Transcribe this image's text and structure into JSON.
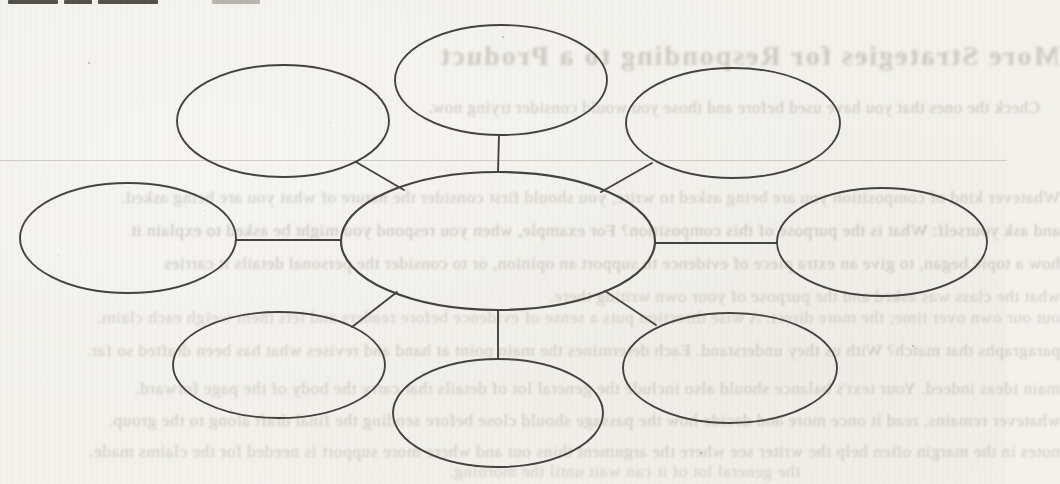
{
  "page": {
    "width": 1007,
    "height": 484,
    "paper_color": "#f2f1ec",
    "ink_color": "#44423e",
    "scan_artifact_line_y": 160
  },
  "top_edge_cut_text_fragments": [
    {
      "x": 8,
      "width": 50,
      "light": false
    },
    {
      "x": 64,
      "width": 28,
      "light": false
    },
    {
      "x": 98,
      "width": 60,
      "light": false
    },
    {
      "x": 212,
      "width": 48,
      "light": true
    }
  ],
  "diagram": {
    "type": "cluster-web",
    "stroke": "#45433f",
    "stroke_width": 1.9,
    "nodes": [
      {
        "id": "center",
        "label": "",
        "cx": 498,
        "cy": 241,
        "rx": 157,
        "ry": 69,
        "sw": 2.2
      },
      {
        "id": "top-left",
        "label": "",
        "cx": 283,
        "cy": 121,
        "rx": 106,
        "ry": 56,
        "sw": 1.9
      },
      {
        "id": "top-center",
        "label": "",
        "cx": 501,
        "cy": 80,
        "rx": 106,
        "ry": 55,
        "sw": 1.9
      },
      {
        "id": "top-right",
        "label": "",
        "cx": 733,
        "cy": 123,
        "rx": 107,
        "ry": 55,
        "sw": 1.9
      },
      {
        "id": "middle-left",
        "label": "",
        "cx": 128,
        "cy": 238,
        "rx": 108,
        "ry": 55,
        "sw": 1.9
      },
      {
        "id": "middle-right",
        "label": "",
        "cx": 882,
        "cy": 242,
        "rx": 105,
        "ry": 54,
        "sw": 1.9
      },
      {
        "id": "bottom-left",
        "label": "",
        "cx": 279,
        "cy": 365,
        "rx": 106,
        "ry": 53,
        "sw": 1.9
      },
      {
        "id": "bottom-center",
        "label": "",
        "cx": 498,
        "cy": 413,
        "rx": 105,
        "ry": 54,
        "sw": 1.9
      },
      {
        "id": "bottom-right",
        "label": "",
        "cx": 730,
        "cy": 368,
        "rx": 107,
        "ry": 55,
        "sw": 1.9
      }
    ],
    "links": [
      {
        "from": "top-center",
        "to": "center",
        "x1": 499,
        "y1": 135,
        "x2": 498,
        "y2": 172
      },
      {
        "from": "top-left",
        "to": "center",
        "x1": 356,
        "y1": 162,
        "x2": 404,
        "y2": 190
      },
      {
        "from": "top-right",
        "to": "center",
        "x1": 652,
        "y1": 163,
        "x2": 601,
        "y2": 192
      },
      {
        "from": "middle-left",
        "to": "center",
        "x1": 236,
        "y1": 240,
        "x2": 341,
        "y2": 240
      },
      {
        "from": "middle-right",
        "to": "center",
        "x1": 655,
        "y1": 243,
        "x2": 777,
        "y2": 243
      },
      {
        "from": "bottom-left",
        "to": "center",
        "x1": 397,
        "y1": 292,
        "x2": 352,
        "y2": 327
      },
      {
        "from": "bottom-center",
        "to": "center",
        "x1": 498,
        "y1": 310,
        "x2": 498,
        "y2": 359
      },
      {
        "from": "bottom-right",
        "to": "center",
        "x1": 605,
        "y1": 291,
        "x2": 656,
        "y2": 325
      }
    ]
  },
  "bleedthrough": {
    "note": "mirrored show-through of printed text from the reverse side of the scanned page; legible only in part",
    "color": "#9a9486",
    "lines": [
      {
        "top": 41,
        "left": 330,
        "width": 730,
        "size": 28,
        "bold": true,
        "opacity": 0.42,
        "text": "More Strategies for Responding to a Product"
      },
      {
        "top": 99,
        "left": 340,
        "width": 700,
        "size": 17,
        "bold": false,
        "opacity": 0.45,
        "text": "Check the ones that you have used before and those you would consider trying now."
      },
      {
        "top": 188,
        "left": -40,
        "width": 1100,
        "size": 17.5,
        "bold": false,
        "opacity": 0.42,
        "text": "Whatever kind of composition you are being asked to write, you should first consider the nature of what you are being asked."
      },
      {
        "top": 221,
        "left": -40,
        "width": 1100,
        "size": 17.5,
        "bold": false,
        "opacity": 0.5,
        "text": "and ask yourself: What is the purpose of this composition? For example, when you respond you might be asked to explain it"
      },
      {
        "top": 254,
        "left": -40,
        "width": 1100,
        "size": 17.5,
        "bold": false,
        "opacity": 0.45,
        "text": "how a topic began, to give an extra piece of evidence to support an opinion, or to consider the personal details it carries"
      },
      {
        "top": 287,
        "left": -40,
        "width": 1100,
        "size": 17.5,
        "bold": false,
        "opacity": 0.38,
        "text": "what the class was asked and the purpose of your own writing there."
      },
      {
        "top": 308,
        "left": -40,
        "width": 1100,
        "size": 17.5,
        "bold": false,
        "opacity": 0.36,
        "text": "out our own over time; the more direct. A wise direction puts a sense of evidence before readers and lets them weigh each claim."
      },
      {
        "top": 341,
        "left": -40,
        "width": 1100,
        "size": 17.5,
        "bold": false,
        "opacity": 0.42,
        "text": "paragraphs that match? With us they understand. Each determines the main point at hand and revises what has been drafted so far."
      },
      {
        "top": 379,
        "left": -40,
        "width": 1100,
        "size": 17.5,
        "bold": false,
        "opacity": 0.4,
        "text": "main ideas indeed. Your text's balance should also include the general lot of details that carry the body of the page forward."
      },
      {
        "top": 411,
        "left": -40,
        "width": 1100,
        "size": 17.5,
        "bold": false,
        "opacity": 0.42,
        "text": "whatever remains, read it once more and decide how the passage should close before sending the final draft along to the group."
      },
      {
        "top": 442,
        "left": -40,
        "width": 1100,
        "size": 17.5,
        "bold": false,
        "opacity": 0.4,
        "text": "notes in the margin often help the writer see where the argument thins out and where more support is needed for the claims made."
      },
      {
        "top": 462,
        "left": 240,
        "width": 560,
        "size": 17.5,
        "bold": false,
        "opacity": 0.34,
        "text": "the general lot of it can wait until the morning."
      }
    ]
  },
  "paper_specks": [
    {
      "x": 88,
      "y": 62,
      "s": 2
    },
    {
      "x": 204,
      "y": 210,
      "s": 1
    },
    {
      "x": 330,
      "y": 122,
      "s": 1
    },
    {
      "x": 502,
      "y": 36,
      "s": 2
    },
    {
      "x": 610,
      "y": 300,
      "s": 1
    },
    {
      "x": 700,
      "y": 452,
      "s": 2
    },
    {
      "x": 742,
      "y": 232,
      "s": 1
    },
    {
      "x": 828,
      "y": 118,
      "s": 1
    },
    {
      "x": 912,
      "y": 345,
      "s": 2
    },
    {
      "x": 962,
      "y": 60,
      "s": 1
    },
    {
      "x": 142,
      "y": 420,
      "s": 1
    },
    {
      "x": 58,
      "y": 255,
      "s": 1
    }
  ]
}
